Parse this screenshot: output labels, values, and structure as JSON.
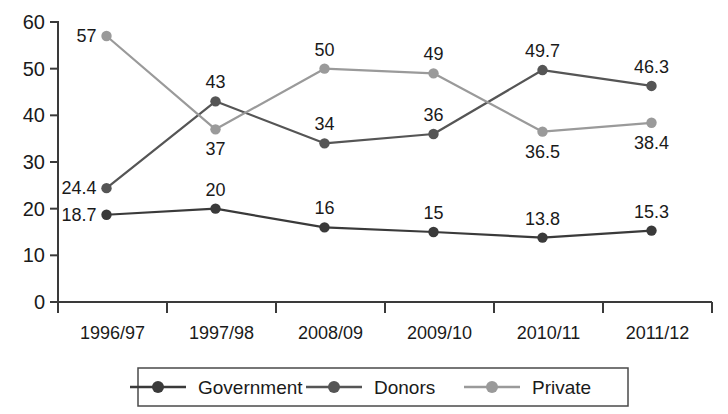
{
  "chart_data": {
    "type": "line",
    "title": "",
    "xlabel": "",
    "ylabel": "",
    "ylim": [
      0,
      60
    ],
    "ytick_values": [
      0,
      10,
      20,
      30,
      40,
      50,
      60
    ],
    "ytick_labels": [
      "0",
      "10",
      "20",
      "30",
      "40",
      "50",
      "60"
    ],
    "grid": false,
    "legend_position": "bottom",
    "categories": [
      "1996/97",
      "1997/98",
      "2008/09",
      "2009/10",
      "2010/11",
      "2011/12"
    ],
    "series": [
      {
        "name": "Government",
        "color": "#3a3a3a",
        "values": [
          18.7,
          20,
          16,
          15,
          13.8,
          15.3
        ],
        "labels": [
          "18.7",
          "20",
          "16",
          "15",
          "13.8",
          "15.3"
        ],
        "label_positions": [
          "left",
          "above",
          "above",
          "above",
          "above",
          "above"
        ]
      },
      {
        "name": "Donors",
        "color": "#555555",
        "values": [
          24.4,
          43,
          34,
          36,
          49.7,
          46.3
        ],
        "labels": [
          "24.4",
          "43",
          "34",
          "36",
          "49.7",
          "46.3"
        ],
        "label_positions": [
          "left",
          "above",
          "above",
          "above",
          "above",
          "above"
        ]
      },
      {
        "name": "Private",
        "color": "#9a9a9a",
        "values": [
          57,
          37,
          50,
          49,
          36.5,
          38.4
        ],
        "labels": [
          "57",
          "37",
          "50",
          "49",
          "36.5",
          "38.4"
        ],
        "label_positions": [
          "left",
          "below",
          "above",
          "above",
          "below",
          "below"
        ]
      }
    ]
  },
  "legend": {
    "items": [
      {
        "label": "Government",
        "color": "#3a3a3a"
      },
      {
        "label": "Donors",
        "color": "#555555"
      },
      {
        "label": "Private",
        "color": "#9a9a9a"
      }
    ]
  },
  "axis": {
    "y_labels": [
      "60",
      "50",
      "40",
      "30",
      "20",
      "10",
      "0"
    ],
    "x_labels": [
      "1996/97",
      "1997/98",
      "2008/09",
      "2009/10",
      "2010/11",
      "2011/12"
    ]
  }
}
